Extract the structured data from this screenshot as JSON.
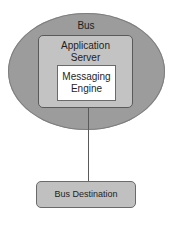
{
  "diagram": {
    "bus": {
      "label": "Bus",
      "shape": "ellipse",
      "fill": "#9c9c9c"
    },
    "application_server": {
      "label_line1": "Application",
      "label_line2": "Server",
      "fill": "#c3c3c3"
    },
    "messaging_engine": {
      "label_line1": "Messaging",
      "label_line2": "Engine",
      "fill": "#ffffff"
    },
    "bus_destination": {
      "label": "Bus Destination",
      "fill": "#c0c0c0"
    },
    "edges": [
      {
        "from": "application_server",
        "to": "bus_destination",
        "style": "line"
      }
    ]
  }
}
